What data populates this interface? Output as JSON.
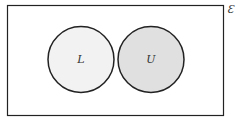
{
  "diagram": {
    "type": "venn",
    "universal_label": "Ɛ",
    "sets": [
      {
        "label": "L",
        "fill": "#f2f2f2"
      },
      {
        "label": "U",
        "fill": "#e0e0e0"
      }
    ],
    "stroke": "#222222",
    "relationship": "disjoint"
  }
}
